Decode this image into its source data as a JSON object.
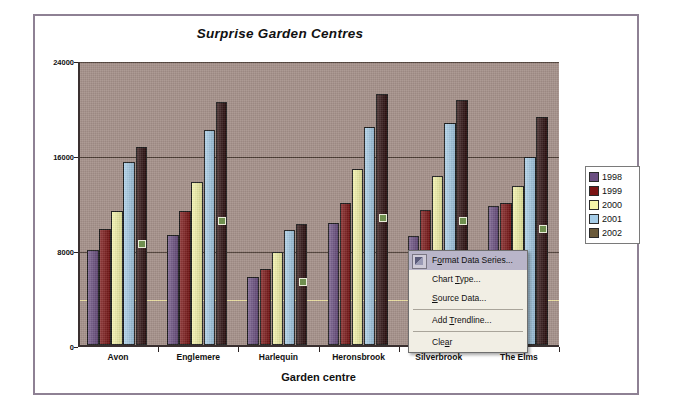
{
  "chart_data": {
    "type": "bar",
    "title": "Surprise Garden Centres",
    "xlabel": "Garden centre",
    "ylabel": "Sales per centre",
    "categories": [
      "Avon",
      "Englemere",
      "Harlequin",
      "Heronsbrook",
      "Silverbrook",
      "The Elms"
    ],
    "series": [
      {
        "name": "1998",
        "color": "#6b4f82",
        "values": [
          8000,
          9300,
          5700,
          10300,
          9200,
          11700
        ]
      },
      {
        "name": "1999",
        "color": "#7b1414",
        "values": [
          9800,
          11300,
          6400,
          12000,
          11400,
          12000
        ]
      },
      {
        "name": "2000",
        "color": "#f5f5a8",
        "values": [
          11300,
          13700,
          7800,
          14800,
          14200,
          13400
        ]
      },
      {
        "name": "2001",
        "color": "#a6cde8",
        "values": [
          15400,
          18100,
          9700,
          18400,
          18700,
          15800
        ]
      },
      {
        "name": "2002",
        "color": "#2b0d0d",
        "values": [
          16700,
          20500,
          10200,
          21100,
          20600,
          19200
        ]
      }
    ],
    "ylim": [
      0,
      24000
    ],
    "yticks": [
      0,
      8000,
      16000,
      24000
    ],
    "ytick_labels": [
      "0",
      "8000",
      "16000",
      "24000"
    ],
    "minor_gridline_values": [
      4000
    ],
    "grid": true,
    "legend_position": "right",
    "plot_background": "#a5918a",
    "selected_series": "2002"
  },
  "legend": {
    "entries": [
      {
        "label": "1998",
        "color": "#6b4f82"
      },
      {
        "label": "1999",
        "color": "#7b1414"
      },
      {
        "label": "2000",
        "color": "#f5f5a8"
      },
      {
        "label": "2001",
        "color": "#a6cde8"
      },
      {
        "label": "2002",
        "color": "#6b5a3a"
      }
    ]
  },
  "context_menu": {
    "items": [
      {
        "label": "Format Data Series...",
        "selected": true,
        "separator_after": false,
        "underline": "o"
      },
      {
        "label": "Chart Type...",
        "selected": false,
        "separator_after": false,
        "underline": "T"
      },
      {
        "label": "Source Data...",
        "selected": false,
        "separator_after": true,
        "underline": "S"
      },
      {
        "label": "Add Trendline...",
        "selected": false,
        "separator_after": true,
        "underline": "T"
      },
      {
        "label": "Clear",
        "selected": false,
        "separator_after": false,
        "underline": "a"
      }
    ]
  }
}
